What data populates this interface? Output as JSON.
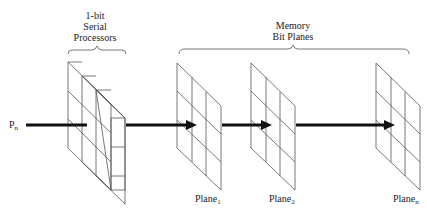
{
  "labels": {
    "processors_line1": "1-bit",
    "processors_line2": "Serial",
    "processors_line3": "Processors",
    "memory_line1": "Memory",
    "memory_line2": "Bit Planes",
    "input": "P",
    "input_sub": "n",
    "plane1": "Plane",
    "plane1_sub": "1",
    "plane2": "Plane",
    "plane2_sub": "2",
    "planen": "Plane",
    "planen_sub": "n"
  },
  "colors": {
    "stroke": "#555555",
    "arrow": "#111111"
  }
}
